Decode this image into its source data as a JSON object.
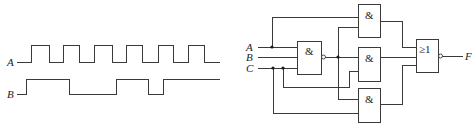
{
  "timing_diagram": {
    "signals": [
      {
        "name": "A",
        "label": "A",
        "low_y": 62,
        "high_y": 45,
        "start_x": 17,
        "end_x": 220,
        "initial": 0,
        "edges": [
          31,
          49,
          63,
          79,
          94,
          112,
          126,
          142,
          158,
          173,
          188,
          204
        ]
      },
      {
        "name": "B",
        "label": "B",
        "low_y": 94,
        "high_y": 79,
        "start_x": 17,
        "end_x": 220,
        "initial": 0,
        "edges": [
          26,
          69,
          116,
          148,
          163
        ]
      }
    ]
  },
  "logic_circuit": {
    "inputs": [
      {
        "label": "A",
        "y": 47
      },
      {
        "label": "B",
        "y": 57
      },
      {
        "label": "C",
        "y": 68
      }
    ],
    "gates": [
      {
        "id": "nand1",
        "type": "NAND",
        "symbol": "&",
        "x": 297,
        "y": 41,
        "w": 24,
        "h": 33,
        "inverted": true
      },
      {
        "id": "and_top",
        "type": "AND",
        "symbol": "&",
        "x": 358,
        "y": 4,
        "w": 22,
        "h": 33,
        "inverted": false
      },
      {
        "id": "and_mid",
        "type": "AND",
        "symbol": "&",
        "x": 358,
        "y": 47,
        "w": 22,
        "h": 34,
        "inverted": false
      },
      {
        "id": "and_bot",
        "type": "AND",
        "symbol": "&",
        "x": 358,
        "y": 88,
        "w": 22,
        "h": 34,
        "inverted": false
      },
      {
        "id": "nor_out",
        "type": "NOR",
        "symbol": "≥1",
        "x": 416,
        "y": 39,
        "w": 22,
        "h": 33,
        "inverted": true
      }
    ],
    "output": {
      "label": "F",
      "y": 56
    }
  }
}
